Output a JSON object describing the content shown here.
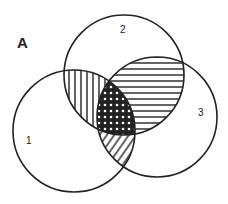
{
  "figure": {
    "panel_label": "A",
    "circles": [
      {
        "id": "1",
        "label": "1",
        "cx": 74,
        "cy": 131,
        "r": 61,
        "label_x": 29,
        "label_y": 143
      },
      {
        "id": "2",
        "label": "2",
        "cx": 124,
        "cy": 75,
        "r": 60,
        "label_x": 123,
        "label_y": 32
      },
      {
        "id": "3",
        "label": "3",
        "cx": 157,
        "cy": 117,
        "r": 60,
        "label_x": 201,
        "label_y": 115
      }
    ],
    "regions": [
      {
        "name": "1∩2 only",
        "pattern": "vertical-lines"
      },
      {
        "name": "2∩3",
        "pattern": "horizontal-lines"
      },
      {
        "name": "1∩3 only",
        "pattern": "diagonal-lines"
      },
      {
        "name": "1∩2∩3",
        "pattern": "cross-hatch"
      }
    ],
    "stroke_color": "#222222",
    "background": "#ffffff"
  }
}
